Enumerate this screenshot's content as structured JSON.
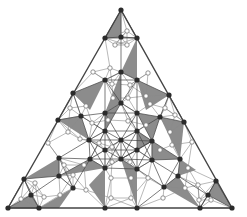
{
  "diagram": {
    "colors": {
      "edge": "#444444",
      "thin_edge": "#8a8a8a",
      "shaded": "#8c8c8c",
      "dark_node": "#2b2b2b",
      "light_node_fill": "#ffffff",
      "light_node_stroke": "#777777",
      "background": "#ffffff"
    },
    "outer_triangle": [
      [
        121,
        10
      ],
      [
        8,
        208
      ],
      [
        232,
        208
      ]
    ],
    "dark_nodes": [
      [
        121,
        10
      ],
      [
        105,
        38
      ],
      [
        121,
        37
      ],
      [
        137,
        38
      ],
      [
        121,
        72
      ],
      [
        105,
        80
      ],
      [
        137,
        80
      ],
      [
        73,
        93
      ],
      [
        169,
        95
      ],
      [
        121,
        103
      ],
      [
        58,
        120
      ],
      [
        81,
        116
      ],
      [
        105,
        113
      ],
      [
        137,
        113
      ],
      [
        160,
        117
      ],
      [
        184,
        122
      ],
      [
        89,
        140
      ],
      [
        105,
        131
      ],
      [
        121,
        140
      ],
      [
        137,
        131
      ],
      [
        152,
        141
      ],
      [
        59,
        158
      ],
      [
        90,
        159
      ],
      [
        105,
        150
      ],
      [
        121,
        159
      ],
      [
        137,
        150
      ],
      [
        152,
        160
      ],
      [
        180,
        159
      ],
      [
        24,
        179
      ],
      [
        59,
        176
      ],
      [
        105,
        168
      ],
      [
        137,
        169
      ],
      [
        178,
        176
      ],
      [
        216,
        181
      ],
      [
        73,
        188
      ],
      [
        31,
        195
      ],
      [
        164,
        187
      ],
      [
        208,
        195
      ],
      [
        8,
        208
      ],
      [
        39,
        208
      ],
      [
        105,
        208
      ],
      [
        137,
        208
      ],
      [
        200,
        208
      ],
      [
        232,
        208
      ]
    ],
    "light_nodes": [
      [
        127,
        31
      ],
      [
        115,
        45
      ],
      [
        127,
        45
      ],
      [
        93,
        72
      ],
      [
        110,
        68
      ],
      [
        148,
        73
      ],
      [
        112,
        84
      ],
      [
        130,
        85
      ],
      [
        146,
        96
      ],
      [
        70,
        108
      ],
      [
        86,
        106
      ],
      [
        92,
        123
      ],
      [
        113,
        98
      ],
      [
        128,
        98
      ],
      [
        150,
        104
      ],
      [
        165,
        108
      ],
      [
        175,
        115
      ],
      [
        108,
        120
      ],
      [
        68,
        132
      ],
      [
        48,
        143
      ],
      [
        80,
        139
      ],
      [
        99,
        143
      ],
      [
        112,
        147
      ],
      [
        128,
        121
      ],
      [
        146,
        125
      ],
      [
        170,
        132
      ],
      [
        192,
        142
      ],
      [
        64,
        165
      ],
      [
        84,
        165
      ],
      [
        112,
        162
      ],
      [
        130,
        162
      ],
      [
        160,
        150
      ],
      [
        188,
        168
      ],
      [
        172,
        145
      ],
      [
        35,
        183
      ],
      [
        21,
        199
      ],
      [
        44,
        197
      ],
      [
        60,
        195
      ],
      [
        73,
        175
      ],
      [
        111,
        178
      ],
      [
        111,
        198
      ],
      [
        131,
        178
      ],
      [
        131,
        198
      ],
      [
        148,
        178
      ],
      [
        163,
        198
      ],
      [
        185,
        188
      ],
      [
        198,
        185
      ],
      [
        199,
        200
      ],
      [
        211,
        200
      ],
      [
        86,
        190
      ]
    ],
    "shaded_triangles": [
      [
        [
          121,
          10
        ],
        [
          105,
          38
        ],
        [
          121,
          37
        ]
      ],
      [
        [
          121,
          72
        ],
        [
          137,
          38
        ],
        [
          137,
          80
        ]
      ],
      [
        [
          73,
          93
        ],
        [
          105,
          80
        ],
        [
          90,
          110
        ]
      ],
      [
        [
          121,
          72
        ],
        [
          105,
          113
        ],
        [
          121,
          103
        ]
      ],
      [
        [
          137,
          80
        ],
        [
          169,
          95
        ],
        [
          146,
          110
        ]
      ],
      [
        [
          58,
          120
        ],
        [
          81,
          116
        ],
        [
          89,
          140
        ]
      ],
      [
        [
          137,
          113
        ],
        [
          160,
          117
        ],
        [
          152,
          141
        ]
      ],
      [
        [
          160,
          117
        ],
        [
          184,
          122
        ],
        [
          180,
          159
        ]
      ],
      [
        [
          105,
          113
        ],
        [
          121,
          103
        ],
        [
          105,
          131
        ]
      ],
      [
        [
          137,
          131
        ],
        [
          152,
          141
        ],
        [
          137,
          150
        ]
      ],
      [
        [
          152,
          141
        ],
        [
          180,
          159
        ],
        [
          152,
          160
        ]
      ],
      [
        [
          24,
          179
        ],
        [
          59,
          176
        ],
        [
          59,
          158
        ]
      ],
      [
        [
          59,
          176
        ],
        [
          90,
          159
        ],
        [
          105,
          168
        ]
      ],
      [
        [
          105,
          168
        ],
        [
          89,
          185
        ],
        [
          105,
          208
        ]
      ],
      [
        [
          121,
          159
        ],
        [
          137,
          169
        ],
        [
          137,
          208
        ]
      ],
      [
        [
          164,
          187
        ],
        [
          178,
          176
        ],
        [
          200,
          208
        ]
      ],
      [
        [
          216,
          181
        ],
        [
          208,
          195
        ],
        [
          232,
          208
        ]
      ],
      [
        [
          8,
          208
        ],
        [
          31,
          195
        ],
        [
          39,
          208
        ]
      ],
      [
        [
          39,
          208
        ],
        [
          73,
          188
        ],
        [
          59,
          208
        ]
      ],
      [
        [
          180,
          159
        ],
        [
          178,
          176
        ],
        [
          196,
          170
        ]
      ]
    ],
    "caption": "Figure"
  }
}
